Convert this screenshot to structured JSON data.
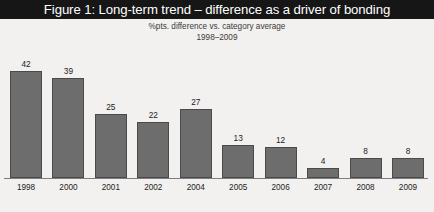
{
  "figure": {
    "title": "Figure 1: Long-term trend – difference as a driver of bonding",
    "subtitle_line1": "%pts. difference vs. category average",
    "subtitle_line2": "1998–2009"
  },
  "colors": {
    "title_bar_background": "#161616",
    "title_text": "#ffffff",
    "page_background": "#f2f1ef",
    "bar_fill": "#6d6d6d",
    "bar_outline": "#4a4a4a",
    "axis_line": "#7d7d7d",
    "label_text": "#1c1c1c"
  },
  "chart_data": {
    "type": "bar",
    "title": "Figure 1: Long-term trend – difference as a driver of bonding",
    "subtitle": "%pts. difference vs. category average 1998–2009",
    "xlabel": "",
    "ylabel": "%pts. difference vs. category average",
    "ylim": [
      0,
      45
    ],
    "grid": false,
    "legend": false,
    "categories": [
      "1998",
      "2000",
      "2001",
      "2002",
      "2004",
      "2005",
      "2006",
      "2007",
      "2008",
      "2009"
    ],
    "values": [
      42,
      39,
      25,
      22,
      27,
      13,
      12,
      4,
      8,
      8
    ],
    "bars": [
      {
        "category": "1998",
        "value": 42,
        "label": "42"
      },
      {
        "category": "2000",
        "value": 39,
        "label": "39"
      },
      {
        "category": "2001",
        "value": 25,
        "label": "25"
      },
      {
        "category": "2002",
        "value": 22,
        "label": "22"
      },
      {
        "category": "2004",
        "value": 27,
        "label": "27"
      },
      {
        "category": "2005",
        "value": 13,
        "label": "13"
      },
      {
        "category": "2006",
        "value": 12,
        "label": "12"
      },
      {
        "category": "2007",
        "value": 4,
        "label": "4"
      },
      {
        "category": "2008",
        "value": 8,
        "label": "8"
      },
      {
        "category": "2009",
        "value": 8,
        "label": "8"
      }
    ]
  }
}
